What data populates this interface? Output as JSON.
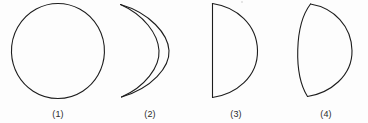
{
  "figure": {
    "background_color": "#fdfdfd",
    "stroke_color": "#1d1d1d",
    "label_color": "#2b2b2b",
    "stroke_width": 1.1,
    "width": 368,
    "height": 123
  },
  "shapes": [
    {
      "id": "shape-1",
      "label": "(1)",
      "name": "circle",
      "description": "full circle outline",
      "left": 8,
      "width": 100,
      "path": "M 50.0 3.5 A 46.5 47.5 0 1 1 49.9 3.5 Z"
    },
    {
      "id": "shape-2",
      "label": "(2)",
      "name": "crescent",
      "description": "crescent lune formed by two arcs meeting at top and bottom",
      "left": 112,
      "width": 76,
      "path": "M 8.5 4.5 C 38 13 56 34 57 50.5 C 58 67 40 88 9.5 97.0 M 8.5 4.5 C 32 15 46 34 47 50.5 C 48 67 33 87 9.5 97.0"
    },
    {
      "id": "shape-3",
      "label": "(3)",
      "name": "half-disc-straight-edge",
      "description": "semicircle with straight vertical left edge and arc on the right",
      "left": 198,
      "width": 76,
      "path": "M 14.5 3.5 L 14.5 97.5 M 14.5 3.5 C 38 7 59 24 59.5 50.5 C 60 77 38 94 14.5 97.5"
    },
    {
      "id": "shape-4",
      "label": "(4)",
      "name": "half-disc-curved-edge",
      "description": "half-disc shape with outward curved left edge and arc on the right",
      "left": 286,
      "width": 80,
      "path": "M 24.5 4.0 C 8.5 25 7.5 74 21.5 96.5 M 24.5 4.0 C 48 8 65.5 26 66 50.5 C 66.5 76 44 93 21.5 96.5"
    }
  ]
}
